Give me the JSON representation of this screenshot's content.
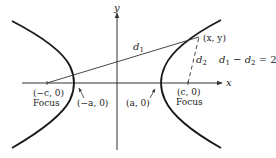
{
  "diagram": {
    "axes": {
      "x_label": "x",
      "y_label": "y"
    },
    "points": {
      "left_focus": {
        "coord": "(−c, 0)",
        "caption": "Focus"
      },
      "right_focus": {
        "coord": "(c, 0)",
        "caption": "Focus"
      },
      "left_vertex": {
        "coord": "(−a, 0)"
      },
      "right_vertex": {
        "coord": "(a, 0)"
      },
      "point": {
        "coord": "(x, y)"
      }
    },
    "distances": {
      "d1": "d",
      "d1_sub": "1",
      "d2": "d",
      "d2_sub": "2"
    },
    "equation": {
      "lhs_d1": "d",
      "sub1": "1",
      "minus": " − ",
      "lhs_d2": "d",
      "sub2": "2",
      "rhs": " = 2",
      "rhs_a": "a"
    },
    "colors": {
      "curve": "#1a1a1a",
      "axis": "#333333",
      "text": "#222222"
    }
  }
}
